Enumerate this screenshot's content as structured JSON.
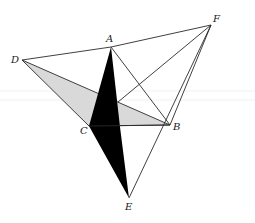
{
  "diagram": {
    "title": "",
    "colors": {
      "background": "#ffffff",
      "line": "#2a2a2a",
      "gray_fill": "#d9d9d9",
      "black_fill": "#000000"
    },
    "points": {
      "A": {
        "label": "A",
        "x": 111,
        "y": 47
      },
      "B": {
        "label": "B",
        "x": 170,
        "y": 125
      },
      "C": {
        "label": "C",
        "x": 89,
        "y": 126
      },
      "D": {
        "label": "D",
        "x": 22,
        "y": 60
      },
      "E": {
        "label": "E",
        "x": 129,
        "y": 198
      },
      "F": {
        "label": "F",
        "x": 211,
        "y": 25
      }
    },
    "labels": {
      "A": "A",
      "B": "B",
      "C": "C",
      "D": "D",
      "E": "E",
      "F": "F"
    },
    "segments": [
      [
        "D",
        "A"
      ],
      [
        "A",
        "F"
      ],
      [
        "D",
        "B"
      ],
      [
        "D",
        "C"
      ],
      [
        "C",
        "B"
      ],
      [
        "A",
        "B"
      ],
      [
        "B",
        "F"
      ],
      [
        "F",
        "E"
      ],
      [
        "F",
        "P"
      ]
    ],
    "shaded_regions": [
      {
        "name": "gray-triangle-DCB",
        "fill": "gray",
        "vertices": [
          "D",
          "C",
          "B"
        ]
      },
      {
        "name": "black-quadrilateral-ACE",
        "fill": "black",
        "vertices": [
          "A",
          "C",
          "E",
          "P"
        ]
      }
    ],
    "helper_point": {
      "name": "P",
      "x": 120,
      "y": 127,
      "visible_label": false
    }
  }
}
